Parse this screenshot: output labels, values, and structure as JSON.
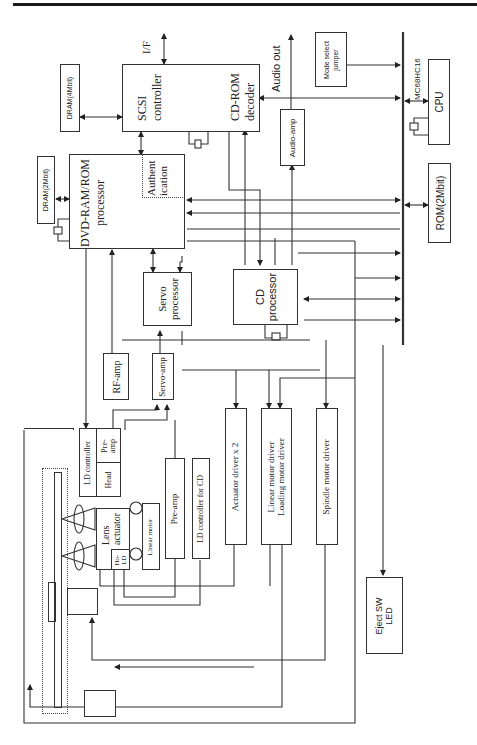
{
  "diagram": {
    "orientation": "rotated 90 degrees counter-clockwise",
    "blocks": {
      "dram4": "DRAM(4Mbit)",
      "scsi": [
        "SCSI",
        "controller"
      ],
      "cdrom_decoder": [
        "CD-ROM",
        "decoder"
      ],
      "audio_amp": "Audio-amp",
      "mode_select": [
        "Mode select",
        "jumper"
      ],
      "cpu": "CPU",
      "cpu_part": "MC68HC16",
      "rom": "ROM(2Mbit)",
      "dram2": "DRAM(2Mbit)",
      "dvd_processor": [
        "DVD-RAM/ROM",
        "processor"
      ],
      "authentication": [
        "Authent",
        "ication"
      ],
      "servo_processor": [
        "Servo",
        "processor"
      ],
      "cd_processor": [
        "CD",
        "processor"
      ],
      "rf_amp": "RF-amp",
      "servo_amp": "Servo-amp",
      "ld_controller": "LD controller",
      "pre_amp_head": [
        "Pre-",
        "amp"
      ],
      "head": "Head",
      "lens_actuator": [
        "Lens",
        "actuator"
      ],
      "holo_ld": [
        "Ho-",
        "LD"
      ],
      "linear_motor": "Linear motor",
      "pre_amp": "Pre-amp",
      "ld_controller_cd": "LD controller for CD",
      "actuator_driver": "Actuator driver x 2",
      "linear_motor_driver": [
        "Linear motor driver",
        "Loading motor driver"
      ],
      "spindle_motor_driver": "Spindle motor driver",
      "eject": [
        "Eject SW",
        "LED"
      ]
    },
    "labels": {
      "interface": "I/F",
      "audio_out": "Audio out"
    },
    "colors": {
      "line": "#333333",
      "background": "#ffffff"
    }
  }
}
